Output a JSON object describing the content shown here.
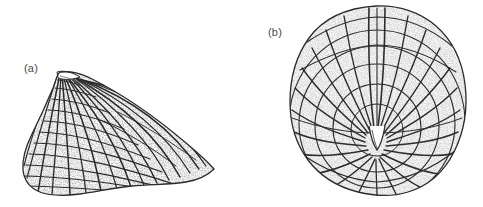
{
  "figure": {
    "background_color": "#ffffff",
    "ink_color": "#2b2b2b",
    "label_color": "#4a4a4a",
    "width": 483,
    "height": 207,
    "medium": "stippled-ink-line-drawing"
  },
  "panels": [
    {
      "key": "a",
      "label": "(a)",
      "specimen_name": "fossil-shell-lateral-view",
      "view": "lateral",
      "outline_shape": "triangular",
      "label_position": {
        "x": 24,
        "y": 62
      },
      "bounds": {
        "x": 22,
        "y": 70,
        "width": 195,
        "height": 128
      },
      "apex": {
        "x": 60,
        "y": 72
      },
      "ornament": {
        "radial_ribs": 17,
        "growth_lines": 13,
        "texture": "rectangular-grid-of-radial-ribs-and-concentric-growth-lines"
      }
    },
    {
      "key": "b",
      "label": "(b)",
      "specimen_name": "fossil-shell-dorsal-view",
      "view": "dorsal",
      "outline_shape": "broad-oval",
      "label_position": {
        "x": 268,
        "y": 26
      },
      "bounds": {
        "x": 290,
        "y": 5,
        "width": 176,
        "height": 190
      },
      "umbo": {
        "x": 376,
        "y": 130
      },
      "ornament": {
        "radial_ribs": 26,
        "growth_lines": 9,
        "texture": "radiating-ribs-crossed-by-concentric-growth-lines",
        "margin": "crenulated"
      }
    }
  ]
}
